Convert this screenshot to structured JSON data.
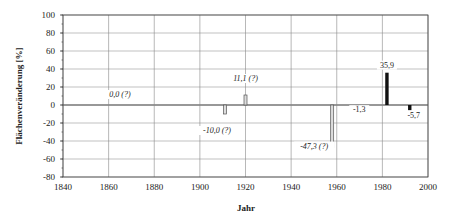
{
  "chart_data": {
    "type": "bar",
    "title": "",
    "xlabel": "Jahr",
    "ylabel": "Flächenveränderung [%]",
    "xlim": [
      1840,
      2000
    ],
    "ylim": [
      -80,
      100
    ],
    "xticks": [
      1840,
      1860,
      1880,
      1900,
      1920,
      1940,
      1960,
      1980,
      2000
    ],
    "yticks": [
      100,
      80,
      60,
      40,
      20,
      0,
      -20,
      -40,
      -60,
      -80
    ],
    "grid": true,
    "legend": null,
    "series": [
      {
        "name": "Flächenveränderung",
        "points": [
          {
            "x": 1865,
            "y": 0.0,
            "label": "0,0 (?)",
            "uncertain": true
          },
          {
            "x": 1911,
            "y": -10.0,
            "label": "-10,0 (?)",
            "uncertain": true
          },
          {
            "x": 1920,
            "y": 11.1,
            "label": "11,1 (?)",
            "uncertain": true
          },
          {
            "x": 1958,
            "y": -47.3,
            "label": "-47,3 (?)",
            "uncertain": true
          },
          {
            "x": 1969,
            "y": -1.3,
            "label": "-1,3",
            "uncertain": false
          },
          {
            "x": 1982,
            "y": 35.9,
            "label": "35,9",
            "uncertain": false
          },
          {
            "x": 1992,
            "y": -5.7,
            "label": "-5,7",
            "uncertain": false
          }
        ]
      }
    ]
  },
  "labels": {
    "xlabel": "Jahr",
    "ylabel": "Flächenveränderung [%]"
  }
}
